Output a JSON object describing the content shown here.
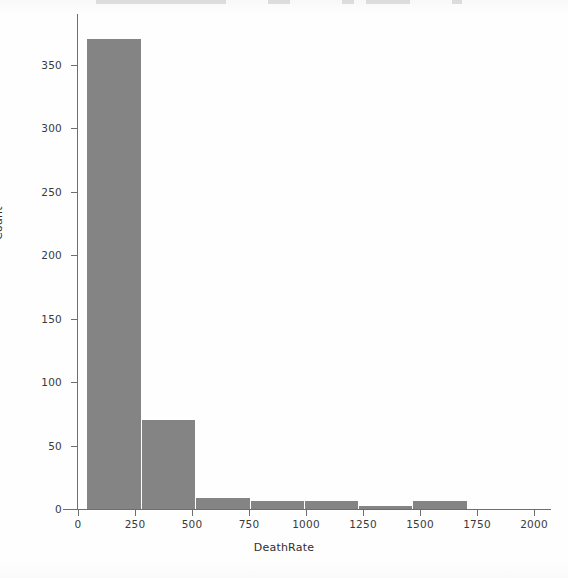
{
  "figure": {
    "background_color": "#fefefe",
    "bar_color": "#848484",
    "axis_color": "#6e6e6e",
    "text_color": "#2f2f2f"
  },
  "chart_data": {
    "type": "bar",
    "title": "",
    "subtitle": "",
    "xlabel": "DeathRate",
    "ylabel": "Count",
    "categories": [
      "0-250",
      "250-500",
      "500-750",
      "750-1000",
      "1000-1250",
      "1250-1500",
      "1500-1750",
      "1750-2000"
    ],
    "bin_starts": [
      0,
      250,
      500,
      750,
      1000,
      1250,
      1500,
      1750
    ],
    "bin_width": 250,
    "values": [
      370,
      70,
      9,
      6,
      6,
      2,
      6,
      0
    ],
    "xlim": [
      -40,
      2060
    ],
    "ylim": [
      0,
      390
    ],
    "xticks": [
      0,
      250,
      500,
      750,
      1000,
      1250,
      1500,
      1750,
      2000
    ],
    "xticklabels": [
      "0",
      "250",
      "500",
      "750",
      "1000",
      "1250",
      "1500",
      "1750",
      "2000"
    ],
    "yticks": [
      0,
      50,
      100,
      150,
      200,
      250,
      300,
      350
    ],
    "yticklabels": [
      "0",
      "50",
      "100",
      "150",
      "200",
      "250",
      "300",
      "350"
    ],
    "grid": false,
    "legend": null,
    "legend_position": "none"
  }
}
